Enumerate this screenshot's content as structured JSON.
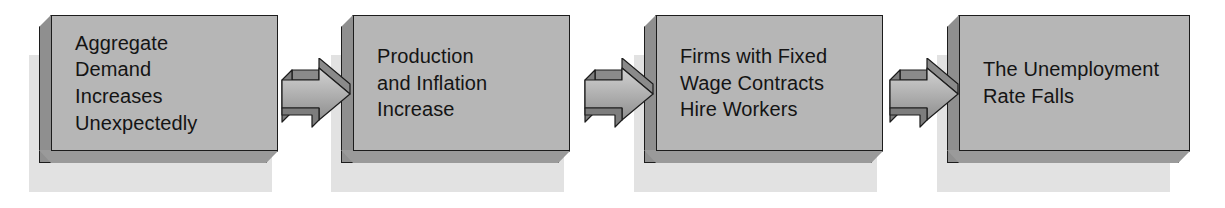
{
  "diagram": {
    "background_color": "#ffffff",
    "box_face_color": "#b6b6b6",
    "box_side_color": "#8f8f8f",
    "box_outline_color": "#1c1c1c",
    "shadow_color": "#e2e2e2",
    "text_color": "#141414",
    "steps": [
      {
        "id": "aggregate-demand",
        "lines": [
          "Aggregate",
          "Demand",
          "Increases",
          "Unexpectedly"
        ],
        "full_text": "Aggregate Demand Increases Unexpectedly"
      },
      {
        "id": "production-inflation",
        "lines": [
          "Production",
          "and Inflation",
          "Increase"
        ],
        "full_text": "Production and Inflation Increase"
      },
      {
        "id": "firms-hire",
        "lines": [
          "Firms with Fixed",
          "Wage Contracts",
          "Hire Workers"
        ],
        "full_text": "Firms with Fixed Wage Contracts Hire Workers"
      },
      {
        "id": "unemployment-falls",
        "lines": [
          "The Unemployment",
          "Rate Falls"
        ],
        "full_text": "The Unemployment Rate Falls"
      }
    ],
    "connectors": [
      {
        "id": "connector-1",
        "icon": "arrow-right-icon",
        "direction": "right"
      },
      {
        "id": "connector-2",
        "icon": "arrow-right-icon",
        "direction": "right"
      },
      {
        "id": "connector-3",
        "icon": "arrow-right-icon",
        "direction": "right"
      }
    ]
  }
}
